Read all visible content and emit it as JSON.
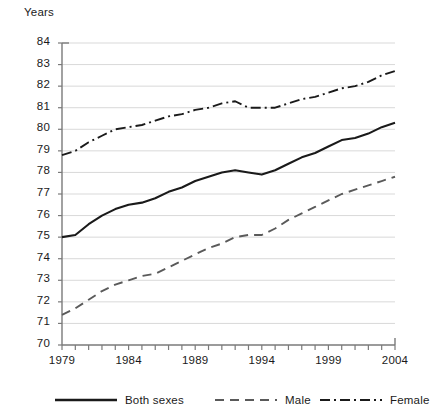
{
  "chart_data": {
    "type": "line",
    "title": "",
    "ylabel": "Years",
    "xlabel": "",
    "ylim": [
      70,
      84
    ],
    "xlim": [
      1979,
      2004
    ],
    "y_ticks": [
      70,
      71,
      72,
      73,
      74,
      75,
      76,
      77,
      78,
      79,
      80,
      81,
      82,
      83,
      84
    ],
    "x_ticks": [
      1979,
      1980,
      1981,
      1982,
      1983,
      1984,
      1985,
      1986,
      1987,
      1988,
      1989,
      1990,
      1991,
      1992,
      1993,
      1994,
      1995,
      1996,
      1997,
      1998,
      1999,
      2000,
      2001,
      2002,
      2003,
      2004
    ],
    "x_tick_labels": [
      "1979",
      "1984",
      "1989",
      "1994",
      "1999",
      "2004"
    ],
    "x_tick_label_values": [
      1979,
      1984,
      1989,
      1994,
      1999,
      2004
    ],
    "grid": true,
    "grid_axis": "y",
    "legend_position": "bottom",
    "x": [
      1979,
      1980,
      1981,
      1982,
      1983,
      1984,
      1985,
      1986,
      1987,
      1988,
      1989,
      1990,
      1991,
      1992,
      1993,
      1994,
      1995,
      1996,
      1997,
      1998,
      1999,
      2000,
      2001,
      2002,
      2003,
      2004
    ],
    "series": [
      {
        "name": "Both sexes",
        "style": "solid",
        "color": "#1a1a1a",
        "values": [
          75.0,
          75.1,
          75.6,
          76.0,
          76.3,
          76.5,
          76.6,
          76.8,
          77.1,
          77.3,
          77.6,
          77.8,
          78.0,
          78.1,
          78.0,
          77.9,
          78.1,
          78.4,
          78.7,
          78.9,
          79.2,
          79.5,
          79.6,
          79.8,
          80.1,
          80.3
        ]
      },
      {
        "name": "Male",
        "style": "dashed",
        "color": "#5a5a5a",
        "values": [
          71.4,
          71.7,
          72.1,
          72.5,
          72.8,
          73.0,
          73.2,
          73.3,
          73.6,
          73.9,
          74.2,
          74.5,
          74.7,
          75.0,
          75.1,
          75.1,
          75.4,
          75.8,
          76.1,
          76.4,
          76.7,
          77.0,
          77.2,
          77.4,
          77.6,
          77.8
        ]
      },
      {
        "name": "Female",
        "style": "dashdot",
        "color": "#1a1a1a",
        "values": [
          78.8,
          79.0,
          79.4,
          79.7,
          80.0,
          80.1,
          80.2,
          80.4,
          80.6,
          80.7,
          80.9,
          81.0,
          81.2,
          81.3,
          81.0,
          81.0,
          81.0,
          81.2,
          81.4,
          81.5,
          81.7,
          81.9,
          82.0,
          82.2,
          82.5,
          82.7
        ]
      }
    ]
  },
  "legend": {
    "items": [
      {
        "label": "Both sexes",
        "swatch": "solid-line-swatch"
      },
      {
        "label": "Male",
        "swatch": "dashed-line-swatch"
      },
      {
        "label": "Female",
        "swatch": "dashdot-line-swatch"
      }
    ]
  },
  "colors": {
    "ink": "#1a1a1a",
    "male_line": "#5a5a5a",
    "grid": "#d9d9d9",
    "axis": "#7a7a7a",
    "background": "#ffffff"
  }
}
